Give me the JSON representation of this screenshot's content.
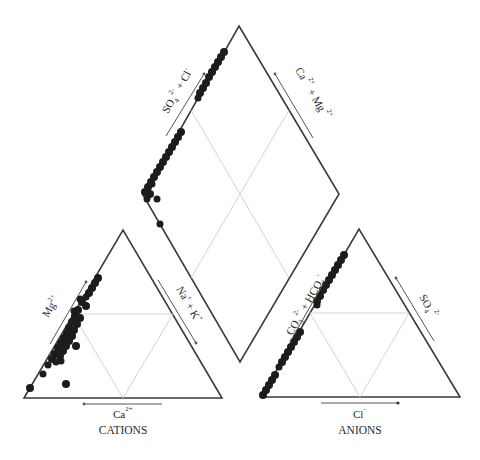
{
  "diagram": {
    "type": "Piper trilinear diagram",
    "cations": {
      "title": "CATIONS",
      "bottom_axis": "Ca",
      "bottom_axis_sup": "2+",
      "left_axis": "Mg",
      "left_axis_sup": "2+",
      "right_axis": "Na",
      "right_axis_sup": "+",
      "right_axis_2": "+ K",
      "right_axis_2_sup": "+"
    },
    "anions": {
      "title": "ANIONS",
      "bottom_axis": "Cl",
      "bottom_axis_sup": "-",
      "left_axis": "CO",
      "left_axis_sub": "3",
      "left_axis_sup": "2-",
      "left_axis_2": "+ HCO",
      "left_axis_2_sub": "3",
      "left_axis_2_sup": "-",
      "right_axis": "SO",
      "right_axis_sub": "4",
      "right_axis_sup": "2-"
    },
    "diamond": {
      "upper_left_axis": "SO",
      "upper_left_axis_sub": "4",
      "upper_left_axis_sup": "2-",
      "upper_left_axis_2": "+ Cl",
      "upper_left_axis_2_sup": "-",
      "upper_right_axis": "Ca",
      "upper_right_axis_sup": "2+",
      "upper_right_axis_2": "+ Mg",
      "upper_right_axis_2_sup": "2+"
    },
    "colors": {
      "frame": "#3a3a3a",
      "grid": "#c8c8c8",
      "points": "#1c1c1c"
    }
  }
}
